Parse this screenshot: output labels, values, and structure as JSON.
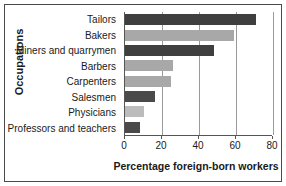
{
  "chart_data": {
    "type": "bar",
    "orientation": "horizontal",
    "title": "",
    "xlabel": "Percentage foreign-born workers",
    "ylabel": "Occupations",
    "categories": [
      "Tailors",
      "Bakers",
      "Miners and quarrymen",
      "Barbers",
      "Carpenters",
      "Salesmen",
      "Physicians",
      "Professors and teachers"
    ],
    "values": [
      71,
      59,
      48,
      26,
      25,
      16,
      10,
      8
    ],
    "xlim": [
      0,
      80
    ],
    "xticks": [
      0,
      20,
      40,
      60,
      80
    ],
    "xticklabels": [
      "0",
      "20",
      "40",
      "60",
      "80"
    ],
    "grid": "vertical",
    "legend": "none",
    "bar_colors": [
      "#3f3f3f",
      "#a8a8a8",
      "#3f3f3f",
      "#a8a8a8",
      "#a8a8a8",
      "#4a4a4a",
      "#bcbcbc",
      "#4a4a4a"
    ]
  },
  "style": {
    "background": "#ffffff",
    "frame_color": "#4a4a4a",
    "gridline_color": "#9a9a9a",
    "axis_color": "#555555",
    "text_color": "#1a1a1a"
  }
}
